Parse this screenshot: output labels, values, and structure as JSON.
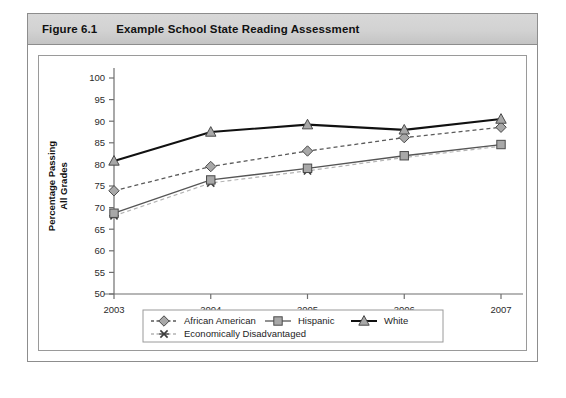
{
  "figure": {
    "number": "Figure 6.1",
    "title": "Example School State Reading Assessment"
  },
  "colors": {
    "banner": "#d2d2d2",
    "frame_border": "#9a9a9a",
    "axis": "#6f6f6f",
    "marker_fill": "#a8a8a8",
    "marker_stroke": "#4a4a4a",
    "white_line": "#111111",
    "african_american_line": "#5a5a5a",
    "hispanic_line": "#555555",
    "econ_line": "#b4b4b4",
    "text": "#1d1d1d"
  },
  "chart_data": {
    "type": "line",
    "title": "Example School State Reading Assessment",
    "xlabel": "",
    "ylabel": "Percentage Passing All Grades",
    "ylabel_lines": [
      "Percentage Passing",
      "All Grades"
    ],
    "categories": [
      "2003",
      "2004",
      "2005",
      "2006",
      "2007"
    ],
    "x": [
      2003,
      2004,
      2005,
      2006,
      2007
    ],
    "ylim": [
      50,
      100
    ],
    "yticks": [
      50,
      55,
      60,
      65,
      70,
      75,
      80,
      85,
      90,
      95,
      100
    ],
    "ytick_labels": [
      "50",
      "55",
      "60",
      "65",
      "70",
      "75",
      "80",
      "85",
      "90",
      "95",
      "100"
    ],
    "grid": false,
    "legend_position": "bottom",
    "series": [
      {
        "name": "African American",
        "marker": "diamond",
        "line_style": "dashed",
        "color": "#5a5a5a",
        "values": [
          73.9,
          79.5,
          83.1,
          86.2,
          88.6
        ]
      },
      {
        "name": "Hispanic",
        "marker": "square",
        "line_style": "solid",
        "color": "#555555",
        "values": [
          68.7,
          76.4,
          79.1,
          82.0,
          84.6
        ]
      },
      {
        "name": "White",
        "marker": "triangle",
        "line_style": "solid",
        "color": "#111111",
        "values": [
          80.8,
          87.5,
          89.2,
          88.0,
          90.5
        ]
      },
      {
        "name": "Economically Disadvantaged",
        "marker": "x",
        "line_style": "dashed",
        "color": "#b4b4b4",
        "values": [
          68.1,
          75.7,
          78.5,
          81.6,
          84.2
        ]
      }
    ]
  },
  "legend": {
    "items": [
      {
        "label": "African American",
        "marker": "diamond",
        "line_style": "dashed"
      },
      {
        "label": "Hispanic",
        "marker": "square",
        "line_style": "solid"
      },
      {
        "label": "White",
        "marker": "triangle",
        "line_style": "solid"
      },
      {
        "label": "Economically Disadvantaged",
        "marker": "x",
        "line_style": "dashed"
      }
    ]
  }
}
